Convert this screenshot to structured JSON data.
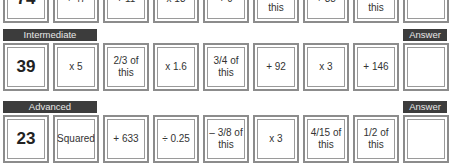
{
  "rows": [
    {
      "level": "",
      "answer_label": "",
      "start": "74",
      "steps": [
        "+ 47",
        "÷ 11",
        "x 13",
        "÷ 9",
        "this",
        "+ 38",
        "this"
      ]
    },
    {
      "level": "Intermediate",
      "answer_label": "Answer",
      "start": "39",
      "steps": [
        "x 5",
        "2/3 of this",
        "x 1.6",
        "3/4 of this",
        "+ 92",
        "x 3",
        "+ 146"
      ]
    },
    {
      "level": "Advanced",
      "answer_label": "Answer",
      "start": "23",
      "steps": [
        "Squared",
        "+ 633",
        "÷ 0.25",
        "– 3/8 of this",
        "x 3",
        "4/15 of this",
        "1/2 of this"
      ]
    }
  ],
  "colors": {
    "header_bg": "#3c3c3c",
    "header_text": "#e8e8e8",
    "box_border": "#8c8c8c"
  }
}
